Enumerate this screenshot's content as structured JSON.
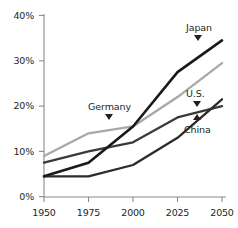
{
  "chart_data": {
    "type": "line",
    "title": "",
    "subtitle": "",
    "xlabel": "",
    "ylabel": "",
    "x": [
      1950,
      1975,
      2000,
      2025,
      2050
    ],
    "xtick_labels": [
      "1950",
      "1975",
      "2000",
      "2025",
      "2050"
    ],
    "ytick_labels": [
      "0%",
      "10%",
      "20%",
      "30%",
      "40%"
    ],
    "ytick_values": [
      0,
      10,
      20,
      30,
      40
    ],
    "xlim": [
      1950,
      2050
    ],
    "ylim": [
      0,
      40
    ],
    "grid": false,
    "legend_position": "inline-annotations",
    "value_unit": "%",
    "series": [
      {
        "name": "Japan",
        "color": "#1a1a1a",
        "values": [
          4.5,
          7.5,
          15.5,
          27.5,
          34.5
        ]
      },
      {
        "name": "Germany",
        "color": "#a8a8a8",
        "values": [
          9.0,
          14.0,
          15.5,
          22.0,
          29.5
        ]
      },
      {
        "name": "U.S.",
        "color": "#3a3a3a",
        "values": [
          7.5,
          10.0,
          12.0,
          17.5,
          20.0
        ]
      },
      {
        "name": "China",
        "color": "#2b2b2b",
        "values": [
          4.5,
          4.5,
          7.0,
          13.0,
          21.5
        ]
      }
    ],
    "annotations": [
      {
        "text": "Japan",
        "marker": "triangle-down",
        "target_series": "Japan"
      },
      {
        "text": "Germany",
        "marker": "triangle-down",
        "target_series": "Germany"
      },
      {
        "text": "U.S.",
        "marker": "triangle-down",
        "target_series": "U.S."
      },
      {
        "text": "China",
        "marker": "triangle-up",
        "target_series": "China"
      }
    ]
  },
  "axes": {
    "y_ticks": [
      {
        "label": "40%"
      },
      {
        "label": "30%"
      },
      {
        "label": "20%"
      },
      {
        "label": "10%"
      },
      {
        "label": "0%"
      }
    ],
    "x_ticks": [
      {
        "label": "1950"
      },
      {
        "label": "1975"
      },
      {
        "label": "2000"
      },
      {
        "label": "2025"
      },
      {
        "label": "2050"
      }
    ]
  },
  "labels": {
    "japan": "Japan",
    "germany": "Germany",
    "us": "U.S.",
    "china": "China"
  },
  "colors": {
    "axis": "#8a8a8a",
    "text": "#231f20",
    "japan_line": "#1a1a1a",
    "germany_line": "#a8a8a8",
    "us_line": "#3a3a3a",
    "china_line": "#2b2b2b",
    "background": "#ffffff"
  }
}
